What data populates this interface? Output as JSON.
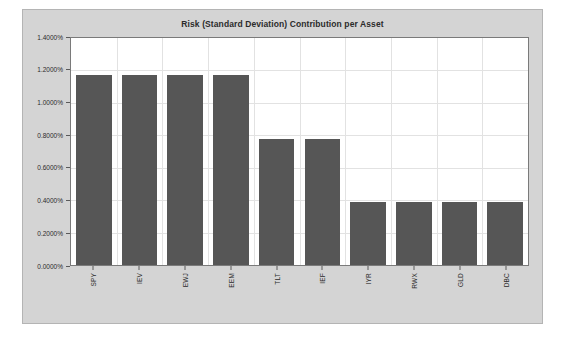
{
  "chart_data": {
    "type": "bar",
    "title": "Risk (Standard Deviation) Contribution per Asset",
    "xlabel": "",
    "ylabel": "",
    "categories": [
      "SPY",
      "IEV",
      "EWJ",
      "EEM",
      "TLT",
      "IEF",
      "IYR",
      "RWX",
      "GLD",
      "DBC"
    ],
    "values": [
      1.17,
      1.17,
      1.17,
      1.17,
      0.775,
      0.775,
      0.39,
      0.39,
      0.39,
      0.39
    ],
    "value_unit": "%",
    "ylim": [
      0.0,
      1.4
    ],
    "ytick_values": [
      0.0,
      0.2,
      0.4,
      0.6,
      0.8,
      1.0,
      1.2,
      1.4
    ],
    "ytick_labels": [
      "0.0000%",
      "0.2000%",
      "0.4000%",
      "0.6000%",
      "0.8000%",
      "1.0000%",
      "1.2000%",
      "1.4000%"
    ],
    "grid": true,
    "legend": false,
    "series": [
      {
        "name": "Risk Contribution",
        "values": [
          1.17,
          1.17,
          1.17,
          1.17,
          0.775,
          0.775,
          0.39,
          0.39,
          0.39,
          0.39
        ]
      }
    ],
    "colors": {
      "bar": "#565656",
      "plot_background": "#ffffff",
      "figure_background": "#d4d4d4",
      "gridline": "#e2e2e2",
      "axis": "#7a7a7a",
      "text": "#2b2b2b"
    }
  }
}
